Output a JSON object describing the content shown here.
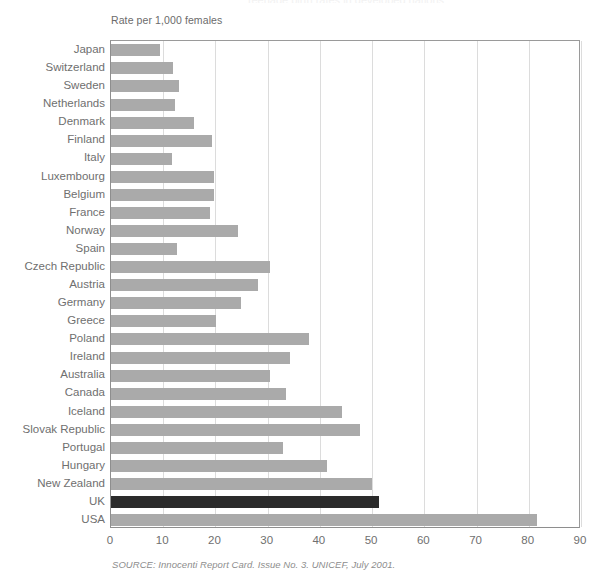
{
  "figure": {
    "clipped_title": "Teenage birth rates in developed nations",
    "axis_note": "Rate per 1,000 females",
    "source": "SOURCE: Innocenti Report Card. Issue No. 3. UNICEF, July 2001.",
    "highlight_color": "#2b2b2b",
    "bar_color": "#aaaaaa",
    "grid_color": "#dcdcdc",
    "axis_color": "#8e8e8e"
  },
  "chart_data": {
    "type": "bar",
    "orientation": "horizontal",
    "title": "Teenage birth rates in developed nations",
    "xlabel": "Rate per 1,000 females",
    "ylabel": "",
    "xlim": [
      0,
      90
    ],
    "xticks": [
      0,
      10,
      20,
      30,
      40,
      50,
      60,
      70,
      80,
      90
    ],
    "grid": "vertical",
    "legend": null,
    "highlight_category": "UK",
    "categories": [
      "Japan",
      "Switzerland",
      "Sweden",
      "Netherlands",
      "Denmark",
      "Finland",
      "Italy",
      "Luxembourg",
      "Belgium",
      "France",
      "Norway",
      "Spain",
      "Czech Republic",
      "Austria",
      "Germany",
      "Greece",
      "Poland",
      "Ireland",
      "Australia",
      "Canada",
      "Iceland",
      "Slovak Republic",
      "Portugal",
      "Hungary",
      "New Zealand",
      "UK",
      "USA"
    ],
    "values": [
      9.3,
      11.8,
      13.1,
      12.2,
      15.8,
      19.3,
      11.6,
      19.7,
      19.7,
      18.9,
      24.3,
      12.7,
      30.5,
      28.1,
      24.8,
      20.1,
      37.9,
      34.2,
      30.5,
      33.6,
      44.2,
      47.6,
      32.9,
      41.4,
      50.0,
      51.4,
      81.5
    ]
  },
  "x_tick_labels": [
    "0",
    "10",
    "20",
    "30",
    "40",
    "50",
    "60",
    "70",
    "80",
    "90"
  ]
}
